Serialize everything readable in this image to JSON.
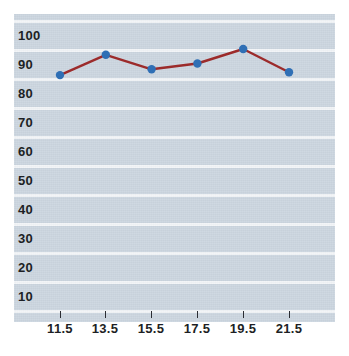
{
  "chart_data": {
    "type": "line",
    "title": "",
    "xlabel": "",
    "ylabel": "",
    "x": [
      11.5,
      13.5,
      15.5,
      17.5,
      19.5,
      21.5
    ],
    "values": [
      81,
      88,
      83,
      85,
      90,
      82
    ],
    "series": [
      {
        "name": "series-1",
        "values": [
          81,
          88,
          83,
          85,
          90,
          82
        ]
      }
    ],
    "categories": [
      "11.5",
      "13.5",
      "15.5",
      "17.5",
      "19.5",
      "21.5"
    ],
    "x_tick_labels": [
      "11.5",
      "13.5",
      "15.5",
      "17.5",
      "19.5",
      "21.5"
    ],
    "y_tick_labels": [
      "100",
      "90",
      "80",
      "70",
      "60",
      "50",
      "40",
      "30",
      "20",
      "10"
    ],
    "y_ticks": [
      100,
      90,
      80,
      70,
      60,
      50,
      40,
      30,
      20,
      10
    ],
    "ylim": [
      0,
      105
    ],
    "xlim": [
      10.5,
      22.5
    ],
    "grid": true,
    "grid_color": "#f2f5f8",
    "legend": false,
    "legend_position": "none",
    "plot_background": "#ccd6e0",
    "line_color": "#9c2b2b",
    "marker_color": "#2f6fb5",
    "marker_shape": "circle",
    "axis_text_color": "#1d1f24"
  },
  "axes": {
    "y_labels": [
      {
        "text": "100",
        "value": 100
      },
      {
        "text": "90",
        "value": 90
      },
      {
        "text": "80",
        "value": 80
      },
      {
        "text": "70",
        "value": 70
      },
      {
        "text": "60",
        "value": 60
      },
      {
        "text": "50",
        "value": 50
      },
      {
        "text": "40",
        "value": 40
      },
      {
        "text": "30",
        "value": 30
      },
      {
        "text": "20",
        "value": 20
      },
      {
        "text": "10",
        "value": 10
      }
    ],
    "x_labels": [
      {
        "text": "11.5",
        "value": 11.5
      },
      {
        "text": "13.5",
        "value": 13.5
      },
      {
        "text": "15.5",
        "value": 15.5
      },
      {
        "text": "17.5",
        "value": 17.5
      },
      {
        "text": "19.5",
        "value": 19.5
      },
      {
        "text": "21.5",
        "value": 21.5
      }
    ]
  }
}
